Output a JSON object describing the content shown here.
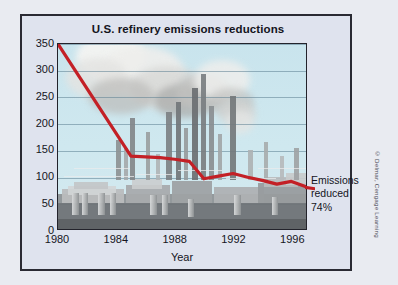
{
  "figure": {
    "title": "U.S. refinery emissions reductions",
    "credit": "© Delmar, Cengage Learning",
    "annotation": {
      "line1": "Emissions",
      "line2": "reduced",
      "line3": "74%"
    }
  },
  "colors": {
    "line": "#c32026",
    "sky": "#cfe7ee",
    "frame": "#2a2a33",
    "panel": "#dfe3ee",
    "grid": "#5c7f92",
    "text": "#14141c",
    "refinery_dark": "#6f7376",
    "refinery_mid": "#9a9ea0",
    "refinery_light": "#c4c7c8",
    "smoke": "#f2f2f0"
  },
  "chart_data": {
    "type": "line",
    "title": "U.S. refinery emissions reductions",
    "xlabel": "Year",
    "ylabel": "",
    "xlim": [
      1980,
      1997
    ],
    "ylim": [
      0,
      350
    ],
    "yticks": [
      0,
      50,
      100,
      150,
      200,
      250,
      300,
      350
    ],
    "xticks": [
      1980,
      1984,
      1988,
      1992,
      1996
    ],
    "grid": true,
    "legend": "none",
    "annotations": [
      "Emissions reduced 74%"
    ],
    "series": [
      {
        "name": "U.S. refinery emissions",
        "color": "#c32026",
        "x": [
          1980,
          1985,
          1987,
          1988,
          1989,
          1990,
          1991,
          1992,
          1993,
          1994,
          1995,
          1996,
          1997
        ],
        "values": [
          350,
          138,
          135,
          132,
          128,
          95,
          100,
          105,
          98,
          92,
          85,
          90,
          80
        ]
      }
    ]
  },
  "refinery": {
    "smoke": [
      {
        "x": 18,
        "y": -10,
        "w": 70,
        "h": 46,
        "c": "#f4f4f2",
        "o": 0.95
      },
      {
        "x": 40,
        "y": 2,
        "w": 86,
        "h": 52,
        "c": "#eeeeec",
        "o": 0.92
      },
      {
        "x": 8,
        "y": 14,
        "w": 62,
        "h": 40,
        "c": "#e4e4e2",
        "o": 0.85
      },
      {
        "x": 72,
        "y": 22,
        "w": 74,
        "h": 44,
        "c": "#d8d8d6",
        "o": 0.8
      },
      {
        "x": 30,
        "y": 34,
        "w": 66,
        "h": 36,
        "c": "#bdbdbb",
        "o": 0.72
      },
      {
        "x": 96,
        "y": 40,
        "w": 60,
        "h": 34,
        "c": "#a9a9a7",
        "o": 0.7
      },
      {
        "x": 118,
        "y": 30,
        "w": 54,
        "h": 36,
        "c": "#c2c2c0",
        "o": 0.74
      },
      {
        "x": 136,
        "y": 16,
        "w": 56,
        "h": 40,
        "c": "#eeeeec",
        "o": 0.86
      },
      {
        "x": 150,
        "y": 44,
        "w": 46,
        "h": 28,
        "c": "#bfbfbd",
        "o": 0.66
      },
      {
        "x": 160,
        "y": 56,
        "w": 38,
        "h": 26,
        "c": "#d4d4d2",
        "o": 0.7
      },
      {
        "x": 168,
        "y": 66,
        "w": 28,
        "h": 24,
        "c": "#e6e6e4",
        "o": 0.74
      }
    ],
    "stacks": [
      {
        "x": 58,
        "y": 96,
        "w": 5,
        "h": 40,
        "c": "#8d9194"
      },
      {
        "x": 66,
        "y": 104,
        "w": 4,
        "h": 32,
        "c": "#a5a9ab"
      },
      {
        "x": 72,
        "y": 74,
        "w": 5,
        "h": 62,
        "c": "#83878a"
      },
      {
        "x": 88,
        "y": 88,
        "w": 4,
        "h": 48,
        "c": "#9b9fa1"
      },
      {
        "x": 98,
        "y": 110,
        "w": 4,
        "h": 26,
        "c": "#b0b4b6"
      },
      {
        "x": 108,
        "y": 68,
        "w": 6,
        "h": 68,
        "c": "#7d8184"
      },
      {
        "x": 118,
        "y": 58,
        "w": 5,
        "h": 78,
        "c": "#72767a"
      },
      {
        "x": 126,
        "y": 84,
        "w": 4,
        "h": 52,
        "c": "#979b9d"
      },
      {
        "x": 134,
        "y": 44,
        "w": 6,
        "h": 92,
        "c": "#6b6f72"
      },
      {
        "x": 143,
        "y": 30,
        "w": 5,
        "h": 106,
        "c": "#7a7e81"
      },
      {
        "x": 151,
        "y": 62,
        "w": 5,
        "h": 74,
        "c": "#8a8e91"
      },
      {
        "x": 160,
        "y": 90,
        "w": 4,
        "h": 46,
        "c": "#a2a6a8"
      },
      {
        "x": 172,
        "y": 52,
        "w": 6,
        "h": 84,
        "c": "#74787b"
      },
      {
        "x": 182,
        "y": 76,
        "w": 4,
        "h": 60,
        "c": "#9296 98"
      },
      {
        "x": 190,
        "y": 106,
        "w": 5,
        "h": 30,
        "c": "#aeb2b4"
      },
      {
        "x": 206,
        "y": 98,
        "w": 4,
        "h": 38,
        "c": "#a8acae"
      },
      {
        "x": 222,
        "y": 112,
        "w": 4,
        "h": 24,
        "c": "#b6babc"
      },
      {
        "x": 236,
        "y": 104,
        "w": 5,
        "h": 32,
        "c": "#9fa3a5"
      }
    ]
  }
}
